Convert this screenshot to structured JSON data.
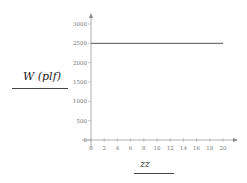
{
  "chart_data": {
    "type": "line",
    "title": "",
    "xlabel": "zz",
    "ylabel": "W (plf)",
    "x": [
      0,
      20
    ],
    "series": [
      {
        "name": "W",
        "values": [
          2500,
          2500
        ],
        "color": "#555555"
      }
    ],
    "xlim": [
      0,
      20
    ],
    "ylim": [
      0,
      3000
    ],
    "xticks": [
      "0",
      "2",
      "4",
      "6",
      "8",
      "10",
      "12",
      "14",
      "16",
      "18",
      "20"
    ],
    "yticks": [
      "0",
      "500",
      "1000",
      "1500",
      "2000",
      "2500",
      "3000"
    ],
    "grid": false,
    "legend": null
  },
  "labels": {
    "ylabel": "W  (plf)",
    "xlabel": "zz"
  }
}
